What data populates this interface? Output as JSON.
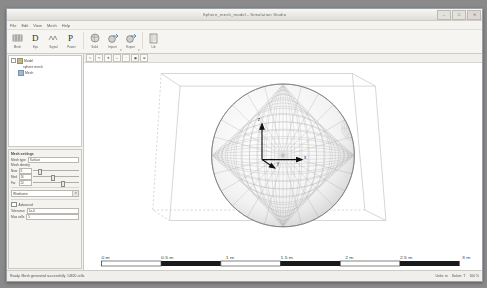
{
  "window": {
    "title": "Sphere_mesh_model - Simulation Studio",
    "buttons": {
      "minimize": "–",
      "maximize": "□",
      "close": "✕"
    }
  },
  "menu": {
    "items": [
      {
        "label": "File"
      },
      {
        "label": "Edit"
      },
      {
        "label": "View"
      },
      {
        "label": "Mesh"
      },
      {
        "label": "Help"
      }
    ]
  },
  "toolbar": {
    "groups": [
      {
        "buttons": [
          {
            "icon": "mesh-grid-icon",
            "label": "Mesh",
            "caret": false
          },
          {
            "icon": "dielectric-icon",
            "label": "Eps",
            "caret": false
          },
          {
            "icon": "waveform-icon",
            "label": "Signal",
            "caret": false
          },
          {
            "icon": "power-p-icon",
            "label": "Power",
            "caret": false
          }
        ]
      },
      {
        "buttons": [
          {
            "icon": "sphere-solid-icon",
            "label": "Solid",
            "caret": false
          },
          {
            "icon": "import-arrow-icon",
            "label": "Import",
            "caret": true
          },
          {
            "icon": "export-arrow-icon",
            "label": "Export",
            "caret": true
          }
        ]
      },
      {
        "buttons": [
          {
            "icon": "book-icon",
            "label": "Lib",
            "caret": false
          }
        ]
      }
    ]
  },
  "tree": {
    "rows": [
      {
        "level": 1,
        "expander": "-",
        "icon": "folder-icon",
        "label": "Model"
      },
      {
        "level": 3,
        "expander": "",
        "icon": "",
        "label": "sphere mesh"
      },
      {
        "level": 2,
        "expander": "",
        "icon": "component-icon",
        "label": "Mesh"
      }
    ]
  },
  "properties": {
    "title": "Mesh settings",
    "name_label": "Mesh type",
    "name_value": "Surface",
    "slider_group_label": "Mesh density",
    "sliders": [
      {
        "label": "Near",
        "value": "8",
        "knob_pct": 12
      },
      {
        "label": "Med",
        "value": "16",
        "knob_pct": 40
      },
      {
        "label": "Far",
        "value": "24",
        "knob_pct": 62
      }
    ],
    "combo_label": "Display mode",
    "combo_value": "Wireframe",
    "combo_arrow": "▾",
    "section_label": "Advanced",
    "fields": [
      {
        "label": "Tolerance",
        "value": "1e-6"
      },
      {
        "label": "Max cells",
        "value": "5"
      }
    ]
  },
  "viewport_toolbar": {
    "buttons": [
      {
        "icon": "cursor-icon",
        "glyph": "↖"
      },
      {
        "icon": "rotate-icon",
        "glyph": "↻"
      },
      {
        "icon": "pan-icon",
        "glyph": "✥"
      },
      {
        "icon": "zoom-in-icon",
        "glyph": "+"
      },
      {
        "icon": "zoom-out-icon",
        "glyph": "−"
      },
      {
        "icon": "fit-icon",
        "glyph": "▣"
      },
      {
        "icon": "axes-icon",
        "glyph": "⊞"
      }
    ]
  },
  "viewport": {
    "axis_labels": {
      "x": "x",
      "y": "y",
      "z": "z"
    },
    "object": "wireframe sphere in bounding box"
  },
  "scalebar": {
    "ticks": [
      "0 m",
      "0.5 m",
      "1 m",
      "1.5 m",
      "2 m",
      "2.5 m",
      "3 m"
    ],
    "segments": 6
  },
  "statusbar": {
    "message": "Ready.  Mesh generated successfully: 14820 cells.",
    "cells": [
      "Units: m",
      "Solver: T",
      "100 %"
    ]
  },
  "colors": {
    "frame": "#9aa0a6",
    "panel": "#f2f1ee",
    "canvas": "#ffffff",
    "mesh": "#8e8e8e",
    "box": "#cccccc",
    "accent": "#3c6fb4"
  }
}
